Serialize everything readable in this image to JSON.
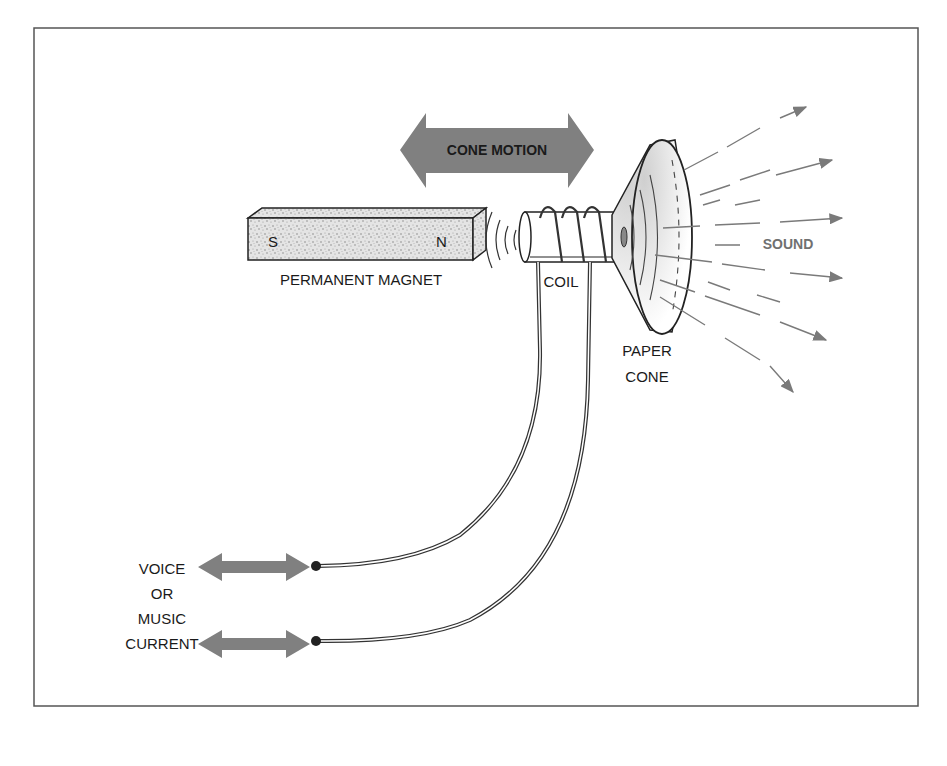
{
  "diagram": {
    "title": "",
    "labels": {
      "cone_motion": "CONE MOTION",
      "magnet_south": "S",
      "magnet_north": "N",
      "permanent_magnet": "PERMANENT MAGNET",
      "coil": "COIL",
      "paper_cone_line1": "PAPER",
      "paper_cone_line2": "CONE",
      "sound": "SOUND",
      "input_line1": "VOICE",
      "input_line2": "OR",
      "input_line3": "MUSIC",
      "input_line4": "CURRENT"
    },
    "colors": {
      "frame": "#555555",
      "arrow_fill": "#808080",
      "ink": "#1a1a1a",
      "sound_lines": "#7a7a7a",
      "sound_text": "#707070",
      "magnet_fill": "#d8d8d8"
    },
    "nodes": [
      {
        "id": "magnet",
        "label": "PERMANENT MAGNET"
      },
      {
        "id": "coil",
        "label": "COIL"
      },
      {
        "id": "cone",
        "label": "PAPER CONE"
      },
      {
        "id": "sound",
        "label": "SOUND"
      },
      {
        "id": "input",
        "label": "VOICE OR MUSIC CURRENT"
      }
    ],
    "edges": [
      {
        "from": "input",
        "to": "coil",
        "type": "wire"
      },
      {
        "from": "magnet",
        "to": "coil",
        "type": "magnetic-field"
      },
      {
        "from": "coil",
        "to": "cone",
        "type": "mechanical"
      },
      {
        "from": "cone",
        "to": "sound",
        "type": "radiation"
      }
    ]
  }
}
